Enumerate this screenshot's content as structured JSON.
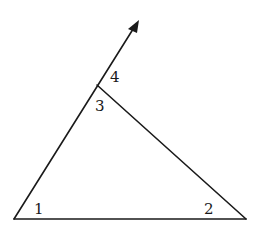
{
  "diagram": {
    "type": "triangle-exterior-angle",
    "angle_labels": {
      "angle1": "1",
      "angle2": "2",
      "angle3": "3",
      "angle4": "4"
    },
    "colors": {
      "stroke": "#1a1a1a",
      "background": "#ffffff"
    }
  }
}
